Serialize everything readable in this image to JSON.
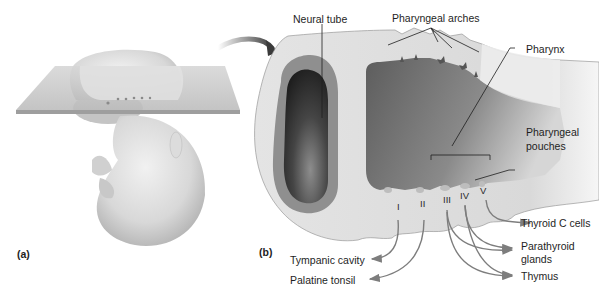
{
  "figure": {
    "panels": [
      {
        "id": "a",
        "label": "(a)"
      },
      {
        "id": "b",
        "label": "(b)"
      }
    ],
    "top_labels": {
      "neural_tube": "Neural tube",
      "pharyngeal_arches": "Pharyngeal arches",
      "pharynx": "Pharynx",
      "pharyngeal_pouches": [
        "Pharyngeal",
        "pouches"
      ]
    },
    "pouch_numerals": [
      "I",
      "II",
      "III",
      "IV",
      "V"
    ],
    "derivatives": {
      "tympanic_cavity": "Tympanic cavity",
      "palatine_tonsil": "Palatine tonsil",
      "thyroid_c_cells": "Thyroid C cells",
      "parathyroid_glands": [
        "Parathyroid",
        "glands"
      ],
      "thymus": "Thymus"
    },
    "colors": {
      "embryo_light": "#e6e6e6",
      "embryo_shadow": "#a9a9a9",
      "plane": "#c9c9c9",
      "neural_wall": "#8a8a8a",
      "neural_lumen": "#2d2d2d",
      "pharynx_dark": "#6a6a6a",
      "tissue": "#dedede",
      "arrow": "#7d7d7d",
      "leader": "#1e1e1e"
    }
  }
}
